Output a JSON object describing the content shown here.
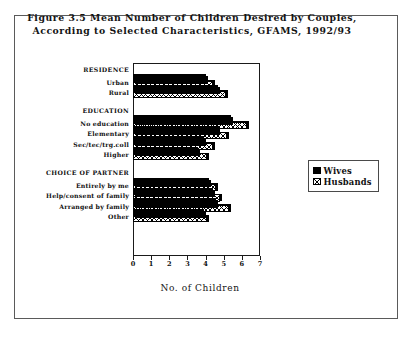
{
  "figure": {
    "title_line1": "Figure 3.5   Mean Number of Children Desired by Couples,",
    "title_line2": "According to Selected Characteristics, GFAMS, 1992/93"
  },
  "legend": {
    "position": "right",
    "entries": [
      {
        "label": "Wives",
        "swatch": "solid-black-square-icon"
      },
      {
        "label": "Husbands",
        "swatch": "crosshatch-square-icon"
      }
    ]
  },
  "chart_data": {
    "type": "bar",
    "orientation": "horizontal",
    "title": "Figure 3.5   Mean Number of Children Desired by Couples, According to Selected Characteristics, GFAMS, 1992/93",
    "xlabel": "No. of Children",
    "ylabel": "",
    "xlim": [
      0,
      7
    ],
    "xticks": [
      0,
      1,
      2,
      3,
      4,
      5,
      6,
      7
    ],
    "xticklabels": [
      "0",
      "1",
      "2",
      "3",
      "4",
      "5",
      "6",
      "7"
    ],
    "grid": false,
    "legend_position": "right",
    "groups": [
      {
        "name": "RESIDENCE",
        "categories": [
          "Urban",
          "Rural"
        ],
        "series": [
          {
            "name": "Wives",
            "values": [
              4.0,
              4.7
            ]
          },
          {
            "name": "Husbands",
            "values": [
              4.4,
              5.1
            ]
          }
        ]
      },
      {
        "name": "EDUCATION",
        "categories": [
          "No education",
          "Elementary",
          "Sec/tec/trg.coll",
          "Higher"
        ],
        "series": [
          {
            "name": "Wives",
            "values": [
              5.4,
              4.7,
              3.9,
              3.6
            ]
          },
          {
            "name": "Husbands",
            "values": [
              6.3,
              5.2,
              4.4,
              4.1
            ]
          }
        ]
      },
      {
        "name": "CHOICE OF PARTNER",
        "categories": [
          "Entirely by me",
          "Help/consent of family",
          "Arranged by family",
          "Other"
        ],
        "series": [
          {
            "name": "Wives",
            "values": [
              4.2,
              4.4,
              4.6,
              3.9
            ]
          },
          {
            "name": "Husbands",
            "values": [
              4.6,
              4.8,
              5.3,
              4.1
            ]
          }
        ]
      }
    ]
  }
}
